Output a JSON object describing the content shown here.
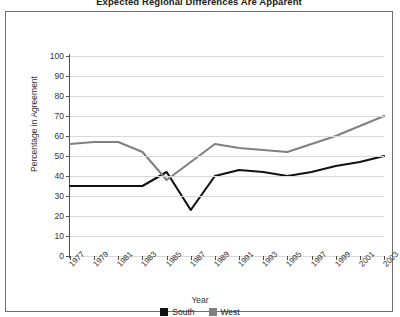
{
  "chart_data": {
    "type": "line",
    "title": "Expected Regional Differences Are Apparent",
    "xlabel": "Year",
    "ylabel": "Percentage in Agreement",
    "x": [
      1977,
      1979,
      1981,
      1983,
      1985,
      1987,
      1989,
      1991,
      1993,
      1995,
      1997,
      1999,
      2001,
      2003
    ],
    "categories": [
      "1977",
      "1979",
      "1981",
      "1983",
      "1985",
      "1987",
      "1989",
      "1991",
      "1993",
      "1995",
      "1997",
      "1999",
      "2001",
      "2003"
    ],
    "series": [
      {
        "name": "South",
        "color": "#111111",
        "values": [
          35,
          35,
          35,
          35,
          42,
          23,
          40,
          43,
          42,
          40,
          42,
          45,
          47,
          50
        ]
      },
      {
        "name": "West",
        "color": "#808080",
        "values": [
          56,
          57,
          57,
          52,
          38,
          47,
          56,
          54,
          53,
          52,
          56,
          60,
          65,
          70
        ]
      }
    ],
    "ylim": [
      0,
      100
    ],
    "yticks": [
      0,
      10,
      20,
      30,
      40,
      50,
      60,
      70,
      80,
      90,
      100
    ],
    "ytick_labels": [
      "0",
      "10",
      "20",
      "30",
      "40",
      "50",
      "60",
      "70",
      "80",
      "90",
      "100"
    ],
    "grid": true,
    "legend_position": "bottom",
    "legend": [
      "South",
      "West"
    ]
  },
  "legend": {
    "items": [
      {
        "label": "South",
        "color": "#111111"
      },
      {
        "label": "West",
        "color": "#808080"
      }
    ]
  },
  "axes": {
    "y_title": "Percentage in Agreement",
    "x_title": "Year"
  }
}
